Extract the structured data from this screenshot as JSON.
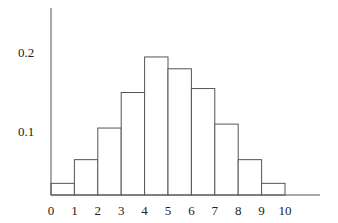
{
  "chart_data": {
    "type": "bar",
    "subtype": "histogram",
    "title": "",
    "xlabel": "",
    "ylabel": "",
    "bin_edges": [
      0,
      1,
      2,
      3,
      4,
      5,
      6,
      7,
      8,
      9,
      10
    ],
    "categories": [
      "0-1",
      "1-2",
      "2-3",
      "3-4",
      "4-5",
      "5-6",
      "6-7",
      "7-8",
      "8-9",
      "9-10"
    ],
    "values": [
      0.035,
      0.065,
      0.105,
      0.15,
      0.195,
      0.18,
      0.155,
      0.11,
      0.065,
      0.035
    ],
    "x_tick_labels": [
      "0",
      "1",
      "2",
      "3",
      "4",
      "5",
      "6",
      "7",
      "8",
      "9",
      "10"
    ],
    "y_tick_labels": [
      "0.1",
      "0.2"
    ],
    "y_ticks": [
      0.1,
      0.2
    ],
    "ylim": [
      0,
      0.25
    ],
    "grid": false,
    "legend": null,
    "bar_fill": "#ffffff",
    "bar_stroke": "#555555"
  }
}
